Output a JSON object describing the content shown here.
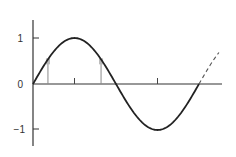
{
  "chart_data": {
    "type": "line",
    "title": "",
    "xlabel": "",
    "ylabel": "",
    "y_ticks": [
      {
        "value": 1,
        "label": "1"
      },
      {
        "value": 0,
        "label": "0"
      },
      {
        "value": -1,
        "label": "−1"
      }
    ],
    "x_ticks": [
      {
        "phase": 0.25,
        "label": ""
      },
      {
        "phase": 0.75,
        "label": ""
      }
    ],
    "ylim": [
      -1.4,
      1.4
    ],
    "series": [
      {
        "name": "sine",
        "style": "solid",
        "function": "sin",
        "phase_start": 0.0,
        "phase_end": 1.0
      },
      {
        "name": "sine-continuation",
        "style": "dashed",
        "function": "sin",
        "phase_start": 1.0,
        "phase_end": 1.12
      }
    ],
    "sample_points": [
      {
        "phase": 0.09,
        "value": 0.54
      },
      {
        "phase": 0.41,
        "value": 0.54
      }
    ],
    "colors": {
      "line": "#222222",
      "axis": "#333333",
      "dropline": "#8a8a8a",
      "marker": "#b8b8b8"
    }
  },
  "axes": {
    "y_labels": {
      "top": "1",
      "zero": "0",
      "bottom": "−1"
    }
  }
}
